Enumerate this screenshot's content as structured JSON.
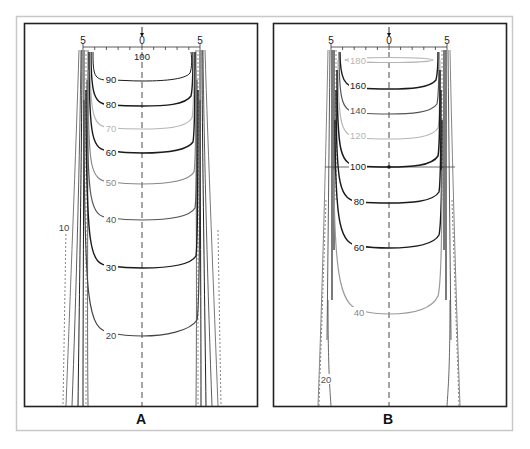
{
  "figure": {
    "colors": {
      "frame": "#c8c8c8",
      "box": "#222222",
      "dark": "#1a1a1a",
      "mid": "#555555",
      "light": "#9a9a9a",
      "lighter": "#b5b5b5"
    },
    "panels": [
      {
        "id": "A",
        "label": "A",
        "ruler": {
          "left": "5",
          "center": "0",
          "right": "5",
          "center_value": "100"
        },
        "contours": [
          {
            "value": "90",
            "tone": "dark"
          },
          {
            "value": "80",
            "tone": "dark"
          },
          {
            "value": "70",
            "tone": "lighter"
          },
          {
            "value": "60",
            "tone": "dark"
          },
          {
            "value": "50",
            "tone": "light"
          },
          {
            "value": "40",
            "tone": "mid"
          },
          {
            "value": "30",
            "tone": "dark"
          },
          {
            "value": "20",
            "tone": "mid"
          },
          {
            "value": "10",
            "tone": "mid"
          }
        ]
      },
      {
        "id": "B",
        "label": "B",
        "ruler": {
          "left": "5",
          "center": "0",
          "right": "5"
        },
        "contours": [
          {
            "value": "180",
            "tone": "lighter"
          },
          {
            "value": "160",
            "tone": "dark"
          },
          {
            "value": "140",
            "tone": "mid"
          },
          {
            "value": "120",
            "tone": "lighter"
          },
          {
            "value": "100",
            "tone": "dark"
          },
          {
            "value": "80",
            "tone": "dark"
          },
          {
            "value": "60",
            "tone": "dark"
          },
          {
            "value": "40",
            "tone": "light"
          },
          {
            "value": "20",
            "tone": "mid"
          }
        ]
      }
    ]
  }
}
